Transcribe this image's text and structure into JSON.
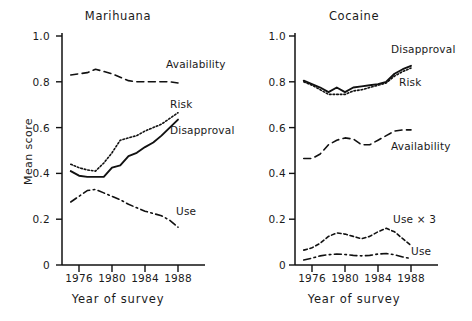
{
  "figure": {
    "panels": [
      "Marihuana",
      "Cocaine"
    ],
    "shared_xlabel": "Year of survey",
    "shared_ylabel": "Mean score"
  },
  "left": {
    "title": "Marihuana",
    "xlabel": "Year of survey",
    "ylabel": "Mean score",
    "yticks": [
      "1.0",
      "0.8",
      "0.6",
      "0.4",
      "0.2",
      "0"
    ],
    "xticks": [
      "1976",
      "1980",
      "1984",
      "1988"
    ],
    "labels": {
      "availability": "Availability",
      "risk": "Risk",
      "disapproval": "Disapproval",
      "use": "Use"
    }
  },
  "right": {
    "title": "Cocaine",
    "xlabel": "Year of survey",
    "ylabel": "Mean score",
    "yticks": [
      "1.0",
      "0.8",
      "0.6",
      "0.4",
      "0.2",
      "0"
    ],
    "xticks": [
      "1976",
      "1980",
      "1984",
      "1988"
    ],
    "labels": {
      "disapproval": "Disapproval",
      "risk": "Risk",
      "availability": "Availability",
      "use_x3": "Use × 3",
      "use": "Use"
    }
  },
  "chart_data": [
    {
      "type": "line",
      "title": "Marihuana",
      "xlabel": "Year of survey",
      "ylabel": "Mean score",
      "xlim": [
        1975,
        1988.5
      ],
      "ylim": [
        0,
        1.0
      ],
      "xticks": [
        1976,
        1980,
        1984,
        1988
      ],
      "yticks": [
        0,
        0.2,
        0.4,
        0.6,
        0.8,
        1.0
      ],
      "grid": false,
      "legend": "inline-annotations",
      "x": [
        1975,
        1976,
        1977,
        1978,
        1979,
        1980,
        1981,
        1982,
        1983,
        1984,
        1985,
        1986,
        1987,
        1988
      ],
      "series": [
        {
          "name": "Availability",
          "style": "dashed",
          "values": [
            0.83,
            0.835,
            0.84,
            0.855,
            0.845,
            0.835,
            0.82,
            0.805,
            0.8,
            0.8,
            0.8,
            0.8,
            0.8,
            0.795
          ]
        },
        {
          "name": "Risk",
          "style": "dotted",
          "values": [
            0.44,
            0.425,
            0.415,
            0.41,
            0.445,
            0.49,
            0.545,
            0.555,
            0.565,
            0.585,
            0.6,
            0.615,
            0.64,
            0.665
          ]
        },
        {
          "name": "Disapproval",
          "style": "solid",
          "values": [
            0.41,
            0.39,
            0.385,
            0.385,
            0.385,
            0.425,
            0.435,
            0.475,
            0.49,
            0.515,
            0.535,
            0.565,
            0.6,
            0.635
          ]
        },
        {
          "name": "Use",
          "style": "dash-dot",
          "values": [
            0.275,
            0.3,
            0.325,
            0.33,
            0.315,
            0.3,
            0.285,
            0.265,
            0.25,
            0.235,
            0.225,
            0.215,
            0.195,
            0.165
          ]
        }
      ]
    },
    {
      "type": "line",
      "title": "Cocaine",
      "xlabel": "Year of survey",
      "ylabel": "Mean score",
      "xlim": [
        1975,
        1988.5
      ],
      "ylim": [
        0,
        1.0
      ],
      "xticks": [
        1976,
        1980,
        1984,
        1988
      ],
      "yticks": [
        0,
        0.2,
        0.4,
        0.6,
        0.8,
        1.0
      ],
      "grid": false,
      "legend": "inline-annotations",
      "x": [
        1975,
        1976,
        1977,
        1978,
        1979,
        1980,
        1981,
        1982,
        1983,
        1984,
        1985,
        1986,
        1987,
        1988
      ],
      "series": [
        {
          "name": "Disapproval",
          "style": "solid",
          "values": [
            0.805,
            0.79,
            0.775,
            0.755,
            0.775,
            0.755,
            0.775,
            0.78,
            0.785,
            0.79,
            0.8,
            0.835,
            0.855,
            0.87
          ]
        },
        {
          "name": "Risk",
          "style": "dotted",
          "values": [
            0.8,
            0.785,
            0.765,
            0.745,
            0.745,
            0.745,
            0.76,
            0.765,
            0.775,
            0.785,
            0.795,
            0.825,
            0.845,
            0.86
          ]
        },
        {
          "name": "Availability",
          "style": "dashed",
          "values": [
            0.465,
            0.465,
            0.485,
            0.525,
            0.545,
            0.555,
            0.55,
            0.525,
            0.525,
            0.545,
            0.565,
            0.585,
            0.59,
            0.59
          ]
        },
        {
          "name": "Use × 3",
          "style": "short-dash",
          "values": [
            0.065,
            0.075,
            0.095,
            0.125,
            0.14,
            0.135,
            0.125,
            0.115,
            0.125,
            0.145,
            0.16,
            0.145,
            0.115,
            0.085
          ]
        },
        {
          "name": "Use",
          "style": "dash-dot",
          "values": [
            0.022,
            0.03,
            0.04,
            0.045,
            0.048,
            0.046,
            0.042,
            0.04,
            0.042,
            0.048,
            0.05,
            0.045,
            0.035,
            0.028
          ]
        }
      ]
    }
  ]
}
